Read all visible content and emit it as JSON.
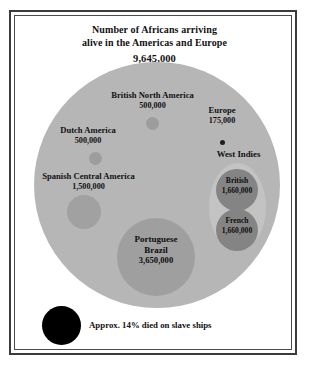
{
  "chart_data": {
    "type": "bubble",
    "title": "Number of Africans arriving alive in the Americas and Europe",
    "title_lines": [
      "Number of Africans arriving",
      "alive in the Americas and Europe"
    ],
    "total_label": "9,645,000",
    "total_value": 9645000,
    "units": "people",
    "grid": false,
    "legend": "none",
    "categories": [
      "British North America",
      "Dutch America",
      "Spanish Central America",
      "Portuguese Brazil",
      "Europe",
      "West Indies British",
      "West Indies French"
    ],
    "values": [
      500000,
      500000,
      1500000,
      3650000,
      175000,
      1660000,
      1660000
    ],
    "groups": [
      {
        "name": "West Indies",
        "label": "West Indies",
        "members": [
          "West Indies British",
          "West Indies French"
        ]
      }
    ],
    "bubbles": [
      {
        "id": "british-north-america",
        "name": "British North America",
        "value_label": "500,000",
        "value": 500000
      },
      {
        "id": "dutch-america",
        "name": "Dutch America",
        "value_label": "500,000",
        "value": 500000
      },
      {
        "id": "spanish-central-america",
        "name": "Spanish Central America",
        "value_label": "1,500,000",
        "value": 1500000
      },
      {
        "id": "portuguese-brazil",
        "name": "Portuguese Brazil",
        "name_line1": "Portuguese",
        "name_line2": "Brazil",
        "value_label": "3,650,000",
        "value": 3650000
      },
      {
        "id": "europe",
        "name": "Europe",
        "value_label": "175,000",
        "value": 175000
      },
      {
        "id": "west-indies-british",
        "name": "British",
        "value_label": "1,660,000",
        "value": 1660000
      },
      {
        "id": "west-indies-french",
        "name": "French",
        "value_label": "1,660,000",
        "value": 1660000
      }
    ],
    "annotation": {
      "text": "Approx. 14% died on slave ships",
      "percent": 14,
      "swatch_color": "#000000"
    },
    "colors": {
      "total_bubble": "#b6b6b6",
      "west_indies_group": "#c3c3c3",
      "brazil": "#9f9f9f",
      "spanish": "#a1a1a1",
      "small_bubbles": "#9d9d9d",
      "west_indies_bubbles": "#848484",
      "died_bubble": "#000000",
      "text": "#111111",
      "frame": "#3b3b3b",
      "background": "#ffffff"
    }
  },
  "chart": {
    "title_line1": "Number of Africans arriving",
    "title_line2": "alive in the Americas and Europe",
    "title_total": "9,645,000",
    "labels": {
      "bna_name": "British North America",
      "bna_value": "500,000",
      "dutch_name": "Dutch America",
      "dutch_value": "500,000",
      "spanish_name": "Spanish Central America",
      "spanish_value": "1,500,000",
      "europe_name": "Europe",
      "europe_value": "175,000",
      "west_indies_name": "West Indies",
      "wi_british_name": "British",
      "wi_british_value": "1,660,000",
      "wi_french_name": "French",
      "wi_french_value": "1,660,000",
      "brazil_name1": "Portuguese",
      "brazil_name2": "Brazil",
      "brazil_value": "3,650,000",
      "died_caption": "Approx. 14% died on slave ships"
    }
  }
}
